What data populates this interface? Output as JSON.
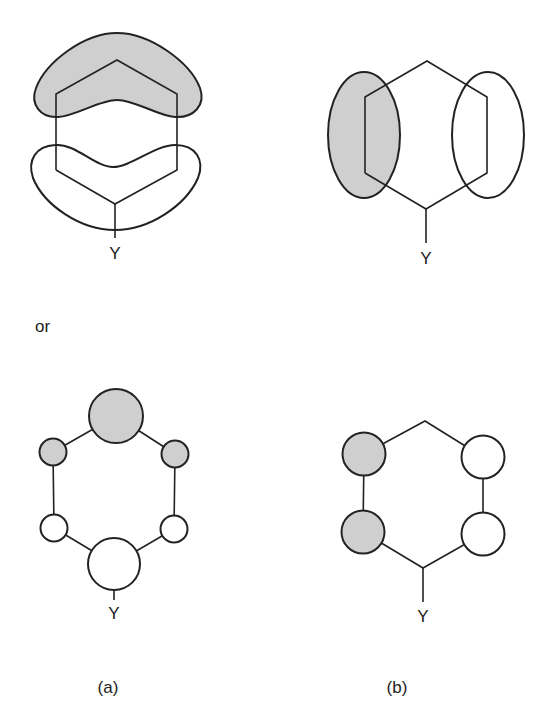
{
  "figure": {
    "colors": {
      "stroke": "#222222",
      "shade": "#cfcfcf",
      "background": "#ffffff"
    },
    "separator_text": "or",
    "panels": {
      "a_lobes": {
        "substituent_label": "Y",
        "description": "Hexagon with two boomerang-shaped lobes; upper lobe shaded, lower lobe open"
      },
      "b_lobes": {
        "substituent_label": "Y",
        "description": "Hexagon with two vertical ellipse lobes on the sides; left shaded, right open"
      },
      "a_atoms": {
        "substituent_label": "Y",
        "description": "Hexagonal ring of six atomic orbital circles; large shaded top, two small shaded upper, two small open lower, large open bottom"
      },
      "b_atoms": {
        "substituent_label": "Y",
        "description": "Hexagon with four equal circles on side vertices; left pair shaded, right pair open"
      }
    },
    "captions": {
      "a": "(a)",
      "b": "(b)"
    }
  }
}
